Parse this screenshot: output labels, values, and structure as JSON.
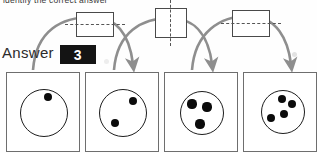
{
  "instruction": {
    "text": "identify the correct answer"
  },
  "answer": {
    "label": "Answer",
    "value": "3"
  },
  "colors": {
    "arrow": "#8e8e8e",
    "box_stroke": "#4a4a4a",
    "panel_stroke": "#6e6e6e",
    "pip": "#0b0b0b",
    "answer_bg": "#141414",
    "answer_fg": "#ffffff",
    "speckle": "#e2e2e2"
  },
  "top_boxes": [
    {
      "name": "fold-box-1",
      "axis": "horizontal",
      "x": 76,
      "y": 12,
      "w": 36,
      "h": 23
    },
    {
      "name": "fold-box-2",
      "axis": "vertical",
      "x": 155,
      "y": 8,
      "w": 30,
      "h": 28
    },
    {
      "name": "fold-box-3",
      "axis": "horizontal",
      "x": 232,
      "y": 10,
      "w": 36,
      "h": 25
    }
  ],
  "arrows": [
    {
      "name": "arrow-1",
      "from_panel": 1,
      "to_panel": 2
    },
    {
      "name": "arrow-2",
      "from_panel": 2,
      "to_panel": 3
    },
    {
      "name": "arrow-3",
      "from_panel": 3,
      "to_panel": 4
    }
  ],
  "panels": [
    {
      "name": "panel-1",
      "index": 1,
      "dot_count": 1,
      "x": 6,
      "ring": {
        "cx": 36,
        "cy": 39,
        "r": 23
      },
      "pips": [
        {
          "cx": 41,
          "cy": 24,
          "r": 4.2
        }
      ]
    },
    {
      "name": "panel-2",
      "index": 2,
      "dot_count": 2,
      "x": 85,
      "ring": {
        "cx": 36,
        "cy": 39,
        "r": 23
      },
      "pips": [
        {
          "cx": 47,
          "cy": 28,
          "r": 4.4
        },
        {
          "cx": 29,
          "cy": 50,
          "r": 4.4
        }
      ]
    },
    {
      "name": "panel-3",
      "index": 3,
      "dot_count": 3,
      "x": 164,
      "ring": {
        "cx": 36,
        "cy": 39,
        "r": 21
      },
      "pips": [
        {
          "cx": 27,
          "cy": 31,
          "r": 4.6
        },
        {
          "cx": 42,
          "cy": 34,
          "r": 4.6
        },
        {
          "cx": 35,
          "cy": 51,
          "r": 4.6
        }
      ]
    },
    {
      "name": "panel-4",
      "index": 4,
      "dot_count": 4,
      "x": 243,
      "ring": {
        "cx": 38,
        "cy": 38,
        "r": 21
      },
      "pips": [
        {
          "cx": 38,
          "cy": 26,
          "r": 4.3
        },
        {
          "cx": 48,
          "cy": 31,
          "r": 4.3
        },
        {
          "cx": 40,
          "cy": 41,
          "r": 4.3
        },
        {
          "cx": 27,
          "cy": 45,
          "r": 4.3
        }
      ]
    }
  ],
  "speckles": [
    {
      "x": 14,
      "y": 82,
      "s": 7
    },
    {
      "x": 50,
      "y": 117,
      "s": 6
    },
    {
      "x": 67,
      "y": 103,
      "s": 7
    },
    {
      "x": 17,
      "y": 133,
      "s": 8
    },
    {
      "x": 124,
      "y": 88,
      "s": 7
    },
    {
      "x": 148,
      "y": 108,
      "s": 7
    },
    {
      "x": 89,
      "y": 132,
      "s": 7
    },
    {
      "x": 168,
      "y": 106,
      "s": 7
    },
    {
      "x": 225,
      "y": 135,
      "s": 6
    },
    {
      "x": 248,
      "y": 105,
      "s": 7
    },
    {
      "x": 292,
      "y": 52,
      "s": 5
    },
    {
      "x": 104,
      "y": 59,
      "s": 5
    }
  ]
}
